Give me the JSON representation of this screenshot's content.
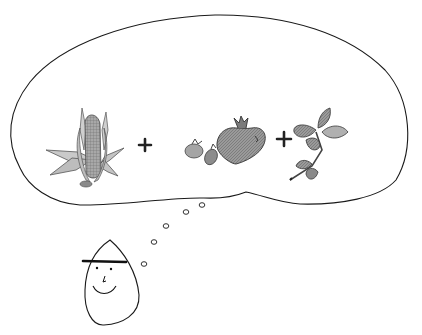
{
  "illustration": {
    "description": "Hand-drawn pencil sketch: a smiling person thinks of corn + tomatoes + basil",
    "thought_cloud": {
      "items": [
        {
          "name": "corn",
          "label": "Corn"
        },
        {
          "operator": "+"
        },
        {
          "name": "tomatoes",
          "label": "Tomatoes"
        },
        {
          "operator": "+"
        },
        {
          "name": "basil",
          "label": "Basil"
        }
      ],
      "plus_sign_1": "+",
      "plus_sign_2": "+"
    },
    "thought_trail_bubbles": 5,
    "person": {
      "expression": "smile",
      "has_hat_brim": true
    },
    "colors": {
      "background": "#ffffff",
      "ink": "#1a1a1a",
      "pencil_shade": "#8a8a8a",
      "dark_shade": "#5a5a5a",
      "light_shade": "#bdbdbd"
    }
  }
}
